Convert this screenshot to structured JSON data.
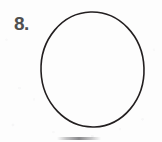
{
  "page": {
    "background_color": "#fdfdfd",
    "width": 162,
    "height": 142
  },
  "item": {
    "number_label": "8.",
    "number_color": "#4f4f4f"
  },
  "figure": {
    "name": "circle",
    "stroke_color": "#231f20",
    "fill": "none",
    "stroke_width": 1.6,
    "center_x": 92.5,
    "center_y": 69.5,
    "radius_x": 51.5,
    "radius_y": 57.5,
    "label": ""
  },
  "artifacts": {
    "bottom_smudge": true,
    "paper_speckle": true
  }
}
